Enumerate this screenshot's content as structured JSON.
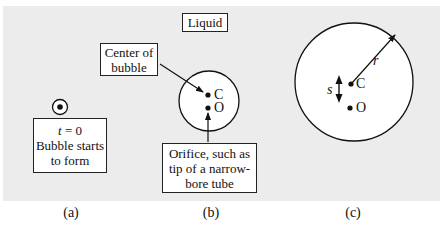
{
  "figure": {
    "liquid_label": "Liquid",
    "panel_a": {
      "caption": "(a)",
      "label_lines": [
        "t = 0",
        "Bubble starts",
        "to form"
      ],
      "time_var": "t",
      "time_eq": " = 0"
    },
    "panel_b": {
      "caption": "(b)",
      "center_label_lines": [
        "Center of",
        "bubble"
      ],
      "orifice_label_lines": [
        "Orifice, such as",
        "tip of a narrow-",
        "bore tube"
      ],
      "point_c": "C",
      "point_o": "O"
    },
    "panel_c": {
      "caption": "(c)",
      "point_c": "C",
      "point_o": "O",
      "radius_label": "r",
      "separation_label": "s"
    }
  },
  "colors": {
    "background_panel": "#ececec",
    "bubble_fill": "#ffffff",
    "stroke": "#111111"
  }
}
